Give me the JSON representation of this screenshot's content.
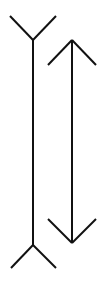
{
  "diagram": {
    "name": "Müller-Lyer illusion",
    "background": "#ffffff",
    "stroke_color": "#111111",
    "stroke_width": 2,
    "figures": [
      {
        "id": "fins-out-line",
        "shaft": {
          "x1": 33,
          "y1": 40,
          "x2": 33,
          "y2": 245
        },
        "top_fins": [
          {
            "x1": 10,
            "y1": 16,
            "x2": 33,
            "y2": 40
          },
          {
            "x1": 56,
            "y1": 16,
            "x2": 33,
            "y2": 40
          }
        ],
        "bottom_fins": [
          {
            "x1": 33,
            "y1": 245,
            "x2": 11,
            "y2": 268
          },
          {
            "x1": 33,
            "y1": 245,
            "x2": 56,
            "y2": 268
          }
        ]
      },
      {
        "id": "double-arrow-line",
        "shaft": {
          "x1": 72,
          "y1": 40,
          "x2": 72,
          "y2": 243
        },
        "top_fins": [
          {
            "x1": 72,
            "y1": 40,
            "x2": 48,
            "y2": 65
          },
          {
            "x1": 72,
            "y1": 40,
            "x2": 96,
            "y2": 65
          }
        ],
        "bottom_fins": [
          {
            "x1": 48,
            "y1": 219,
            "x2": 72,
            "y2": 243
          },
          {
            "x1": 96,
            "y1": 219,
            "x2": 72,
            "y2": 243
          }
        ]
      }
    ]
  }
}
